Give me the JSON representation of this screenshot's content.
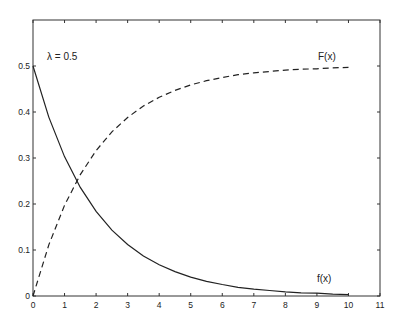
{
  "chart_data": {
    "type": "line",
    "title": "",
    "xlabel": "",
    "ylabel": "",
    "xlim": [
      0,
      11
    ],
    "ylim": [
      0,
      0.5
    ],
    "grid": false,
    "legend": "none (inline labels)",
    "x_ticks": [
      "0",
      "1",
      "2",
      "3",
      "4",
      "5",
      "6",
      "7",
      "8",
      "9",
      "10",
      "11"
    ],
    "y_ticks": [
      "0",
      "0.1",
      "0.2",
      "0.3",
      "0.4",
      "0.5"
    ],
    "annotations": [
      {
        "text": "λ = 0.5",
        "x": 0.45,
        "y": 0.47
      },
      {
        "text": "F(x)",
        "x": 8.6,
        "y": 0.52
      },
      {
        "text": "f(x)",
        "x": 8.5,
        "y": 0.04
      }
    ],
    "x": [
      0,
      0.5,
      1,
      1.5,
      2,
      2.5,
      3,
      3.5,
      4,
      4.5,
      5,
      5.5,
      6,
      6.5,
      7,
      7.5,
      8,
      8.5,
      9,
      9.5,
      10
    ],
    "series": [
      {
        "name": "f(x)",
        "style": "solid",
        "values": [
          0.5,
          0.389,
          0.303,
          0.236,
          0.184,
          0.143,
          0.112,
          0.087,
          0.068,
          0.053,
          0.041,
          0.032,
          0.025,
          0.019,
          0.015,
          0.012,
          0.009,
          0.007,
          0.006,
          0.004,
          0.003
        ]
      },
      {
        "name": "F(x)",
        "style": "dashed",
        "values": [
          0,
          0.111,
          0.197,
          0.264,
          0.316,
          0.357,
          0.388,
          0.413,
          0.432,
          0.447,
          0.459,
          0.468,
          0.475,
          0.481,
          0.485,
          0.488,
          0.491,
          0.493,
          0.494,
          0.496,
          0.497
        ]
      }
    ]
  },
  "labels": {
    "lambda": "λ = 0.5",
    "F": "F(x)",
    "f": "f(x)"
  }
}
